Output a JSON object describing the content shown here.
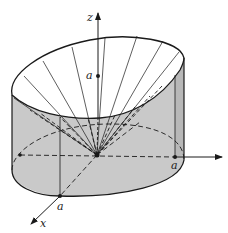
{
  "figure": {
    "colors": {
      "stroke": "#1a1a1a",
      "shade": "#c9c9c9",
      "shade_dark": "#b5b5b5",
      "background": "#ffffff"
    }
  },
  "labels": {
    "z_axis": "z",
    "x_axis": "x",
    "z_a": "a",
    "x_a": "a",
    "y_a": "a"
  }
}
